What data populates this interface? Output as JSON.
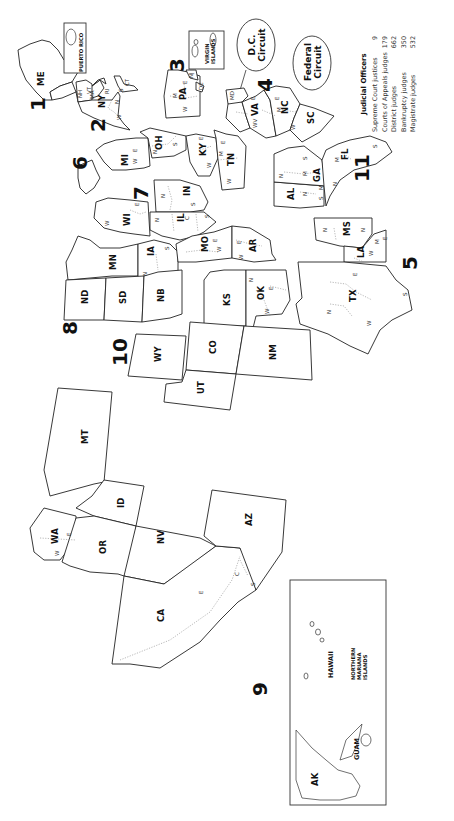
{
  "map": {
    "title": "U.S. Federal Judicial Circuits",
    "orientation": "rotated-90-ccw",
    "circuits": [
      {
        "number": "1",
        "states": [
          "ME",
          "NH",
          "MA",
          "RI"
        ],
        "territories": [
          "PUERTO RICO"
        ]
      },
      {
        "number": "2",
        "states": [
          "NY",
          "VT",
          "CT"
        ]
      },
      {
        "number": "3",
        "states": [
          "PA",
          "NJ",
          "DE"
        ],
        "territories": [
          "VIRGIN ISLANDS"
        ]
      },
      {
        "number": "4",
        "states": [
          "MD",
          "VA",
          "WV",
          "NC",
          "SC"
        ]
      },
      {
        "number": "5",
        "states": [
          "TX",
          "LA",
          "MS"
        ]
      },
      {
        "number": "6",
        "states": [
          "MI",
          "OH",
          "KY",
          "TN"
        ]
      },
      {
        "number": "7",
        "states": [
          "WI",
          "IL",
          "IN"
        ]
      },
      {
        "number": "8",
        "states": [
          "ND",
          "SD",
          "NB",
          "MN",
          "IA",
          "MO",
          "AR"
        ]
      },
      {
        "number": "9",
        "states": [
          "WA",
          "OR",
          "CA",
          "NV",
          "ID",
          "MT",
          "AZ",
          "AK",
          "HAWAII"
        ],
        "territories": [
          "GUAM",
          "NORTHERN MARIANA ISLANDS"
        ]
      },
      {
        "number": "10",
        "states": [
          "WY",
          "UT",
          "CO",
          "KS",
          "OK",
          "NM"
        ]
      },
      {
        "number": "11",
        "states": [
          "AL",
          "GA",
          "FL"
        ]
      }
    ],
    "special_circuits": [
      {
        "line1": "D.C.",
        "line2": "Circuit"
      },
      {
        "line1": "Federal",
        "line2": "Circuit"
      }
    ],
    "inset": {
      "labels": [
        "AK",
        "HAWAII",
        "NORTHERN",
        "MARIANA",
        "ISLANDS",
        "GUAM"
      ]
    },
    "puerto_rico_label": "PUERTO RICO",
    "virgin_islands_label1": "VIRGIN",
    "virgin_islands_label2": "ISLANDS"
  },
  "state_labels": {
    "ME": "ME",
    "NH": "NH",
    "MA": "MA",
    "RI": "RI",
    "NY": "NY",
    "VT": "VT",
    "CT": "CT",
    "PA": "PA",
    "NJ": "NJ",
    "DE": "DE",
    "MD": "MD",
    "VA": "VA",
    "WV": "WV",
    "NC": "NC",
    "SC": "SC",
    "MI": "MI",
    "OH": "OH",
    "KY": "KY",
    "TN": "TN",
    "WI": "WI",
    "IL": "IL",
    "IN": "IN",
    "MN": "MN",
    "IA": "IA",
    "MO": "MO",
    "AR": "AR",
    "ND": "ND",
    "SD": "SD",
    "NB": "NB",
    "KS": "KS",
    "OK": "OK",
    "WY": "WY",
    "CO": "CO",
    "UT": "UT",
    "NM": "NM",
    "TX": "TX",
    "LA": "LA",
    "MS": "MS",
    "AL": "AL",
    "GA": "GA",
    "FL": "FL",
    "WA": "WA",
    "OR": "OR",
    "CA": "CA",
    "NV": "NV",
    "ID": "ID",
    "MT": "MT",
    "AZ": "AZ"
  },
  "district_letters": {
    "N": "N",
    "S": "S",
    "E": "E",
    "W": "W",
    "M": "M",
    "C": "C"
  },
  "legend": {
    "title": "Judicial Officers",
    "rows": [
      {
        "label": "Supreme Court justices",
        "value": "9"
      },
      {
        "label": "Courts of Appeals judges",
        "value": "179"
      },
      {
        "label": "District judges",
        "value": "662"
      },
      {
        "label": "Bankruptcy judges",
        "value": "350"
      },
      {
        "label": "Magistrate judges",
        "value": "532"
      }
    ]
  }
}
